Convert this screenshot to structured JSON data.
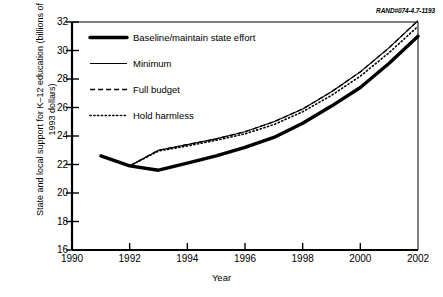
{
  "credit": "RAND#074-4.7-1193",
  "chart_data": {
    "type": "line",
    "title": "",
    "xlabel": "Year",
    "ylabel": "State and local support for K–12 education (billions of 1993 dollars)",
    "xlim": [
      1990,
      2002
    ],
    "ylim": [
      16,
      32
    ],
    "xticks": [
      1990,
      1992,
      1994,
      1996,
      1998,
      2000,
      2002
    ],
    "yticks": [
      16,
      18,
      20,
      22,
      24,
      26,
      28,
      30,
      32
    ],
    "grid": false,
    "legend_position": "upper-left-inside",
    "x": [
      1991,
      1992,
      1993,
      1994,
      1995,
      1996,
      1997,
      1998,
      1999,
      2000,
      2001,
      2002
    ],
    "series": [
      {
        "name": "Baseline/maintain state effort",
        "style": "thick-solid",
        "values": [
          22.6,
          21.9,
          21.6,
          22.1,
          22.6,
          23.2,
          23.9,
          24.9,
          26.1,
          27.4,
          29.1,
          31.0
        ]
      },
      {
        "name": "Minimum",
        "style": "thin-solid",
        "values": [
          22.6,
          21.9,
          23.0,
          23.4,
          23.8,
          24.3,
          25.0,
          25.9,
          27.1,
          28.5,
          30.2,
          32.1
        ]
      },
      {
        "name": "Full budget",
        "style": "dashed",
        "values": [
          22.6,
          21.9,
          23.0,
          23.4,
          23.8,
          24.3,
          25.0,
          25.9,
          27.1,
          28.5,
          30.2,
          32.1
        ]
      },
      {
        "name": "Hold harmless",
        "style": "dotted",
        "values": [
          22.6,
          21.9,
          22.95,
          23.3,
          23.7,
          24.15,
          24.8,
          25.7,
          26.85,
          28.2,
          29.85,
          31.7
        ]
      }
    ]
  },
  "legend": {
    "items": [
      {
        "label": "Baseline/maintain state effort",
        "style": "thick-solid"
      },
      {
        "label": "Minimum",
        "style": "thin-solid"
      },
      {
        "label": "Full budget",
        "style": "dashed"
      },
      {
        "label": "Hold harmless",
        "style": "dotted"
      }
    ]
  },
  "axis_tick_labels": {
    "y": [
      "32",
      "30",
      "28",
      "26",
      "24",
      "22",
      "20",
      "18",
      "16"
    ],
    "x": [
      "1990",
      "1992",
      "1994",
      "1996",
      "1998",
      "2000",
      "2002"
    ]
  }
}
